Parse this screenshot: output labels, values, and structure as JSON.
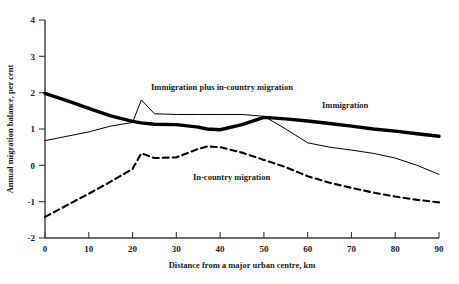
{
  "chart_data": {
    "type": "line",
    "title": "",
    "xlabel": "Distance from a major urban centre, km",
    "ylabel": "Annual migration balance, per cent",
    "xlim": [
      0,
      90
    ],
    "ylim": [
      -2,
      4
    ],
    "xticks": [
      0,
      10,
      20,
      30,
      40,
      50,
      60,
      70,
      80,
      90
    ],
    "yticks": [
      -2,
      -1,
      0,
      1,
      2,
      3,
      4
    ],
    "xtick_labels": [
      "0",
      "10",
      "20",
      "30",
      "40",
      "50",
      "60",
      "70",
      "80",
      "90"
    ],
    "ytick_labels": [
      "-2",
      "-1",
      "0",
      "1",
      "2",
      "3",
      "4"
    ],
    "grid": false,
    "legend_position": "inline-annotations",
    "x": [
      0,
      5,
      10,
      15,
      20,
      22,
      25,
      30,
      35,
      37,
      40,
      45,
      50,
      55,
      60,
      65,
      70,
      75,
      80,
      85,
      90
    ],
    "series": [
      {
        "name": "Immigration",
        "style": "thick-solid",
        "color": "#000000",
        "values": [
          1.98,
          1.78,
          1.57,
          1.36,
          1.21,
          1.17,
          1.13,
          1.12,
          1.05,
          1.0,
          0.98,
          1.12,
          1.32,
          1.28,
          1.22,
          1.15,
          1.08,
          1.0,
          0.94,
          0.87,
          0.8
        ]
      },
      {
        "name": "Immigration plus in-country migration",
        "style": "thin-solid",
        "color": "#000000",
        "values": [
          0.68,
          0.8,
          0.92,
          1.08,
          1.18,
          1.8,
          1.42,
          1.4,
          1.4,
          1.4,
          1.4,
          1.4,
          1.35,
          1.0,
          0.62,
          0.5,
          0.42,
          0.33,
          0.2,
          0.0,
          -0.25
        ]
      },
      {
        "name": "In-country migration",
        "style": "dashed",
        "color": "#000000",
        "values": [
          -1.42,
          -1.1,
          -0.78,
          -0.45,
          -0.1,
          0.33,
          0.2,
          0.22,
          0.45,
          0.52,
          0.5,
          0.35,
          0.15,
          -0.05,
          -0.3,
          -0.48,
          -0.62,
          -0.75,
          -0.86,
          -0.95,
          -1.02
        ]
      }
    ],
    "annotations": [
      {
        "text": "Immigration plus in-country migration",
        "x_px": 151,
        "y_px": 90
      },
      {
        "text": "Immigration",
        "x_px": 322,
        "y_px": 108
      },
      {
        "text": "In-country migration",
        "x_px": 193,
        "y_px": 180
      }
    ]
  }
}
